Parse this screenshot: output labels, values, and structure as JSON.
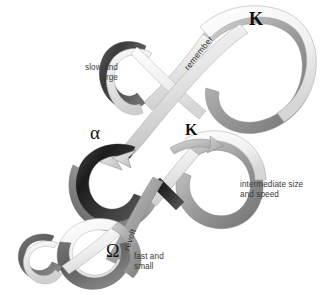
{
  "figure": {
    "background_color": "#ffffff",
    "width": 329,
    "height": 295
  },
  "labels": {
    "slow_large": "slow and\nlarge",
    "intermediate": "intermediate size\nand speed",
    "fast_small": "fast and\nsmall"
  },
  "ribbon_text": {
    "remember": "remember",
    "revolt": "revolt"
  },
  "symbols": {
    "kappa_top": "Κ",
    "kappa_mid": "Κ",
    "alpha": "α",
    "omega": "Ω"
  },
  "cycles": [
    {
      "name": "large-slow-cycle",
      "scale": "slow and large",
      "phase_symbol": "Κ",
      "connector_out": "remember"
    },
    {
      "name": "intermediate-cycle",
      "scale": "intermediate size and speed",
      "phase_symbols": [
        "α",
        "Κ"
      ],
      "connector_out": "revolt"
    },
    {
      "name": "small-fast-cycle",
      "scale": "fast and small",
      "phase_symbol": "Ω"
    }
  ],
  "colors": {
    "background": "#ffffff",
    "text": "#3a3a3a",
    "glyph": "#111111",
    "ribbon_dark": "#2f2f2f",
    "ribbon_mid": "#8d8d8d",
    "ribbon_light": "#ededed",
    "ribbon_edge": "#9a9a9a"
  }
}
